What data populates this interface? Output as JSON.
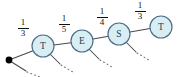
{
  "diagram": {
    "type": "weighted-path-graph",
    "origin": {
      "name": "origin-dot",
      "x": 9,
      "y": 60,
      "color": "#000000"
    },
    "node_fill": "#d8eef2",
    "node_stroke": "#4c6d86",
    "edge_color": "#4a4a4a",
    "nodes": [
      {
        "id": "n1",
        "label": "T",
        "cx": 43,
        "cy": 46,
        "r": 11
      },
      {
        "id": "n2",
        "label": "E",
        "cx": 82,
        "cy": 41,
        "r": 11
      },
      {
        "id": "n3",
        "label": "S",
        "cx": 119,
        "cy": 34,
        "r": 11
      },
      {
        "id": "n4",
        "label": "T",
        "cx": 161,
        "cy": 27,
        "r": 11
      }
    ],
    "edges": [
      {
        "id": "e0",
        "from": "origin",
        "to": "n1",
        "weight_numerator": "1",
        "weight_denominator": "3",
        "label_x": 15,
        "label_y": 18
      },
      {
        "id": "e1",
        "from": "n1",
        "to": "n2",
        "weight_numerator": "1",
        "weight_denominator": "5",
        "label_x": 56,
        "label_y": 14
      },
      {
        "id": "e2",
        "from": "n2",
        "to": "n3",
        "weight_numerator": "1",
        "weight_denominator": "4",
        "label_x": 94,
        "label_y": 7
      },
      {
        "id": "e3",
        "from": "n3",
        "to": "n4",
        "weight_numerator": "1",
        "weight_denominator": "3",
        "label_x": 132,
        "label_y": 1
      }
    ],
    "branches": [
      {
        "id": "b0",
        "from": "origin",
        "solid_x1": 10,
        "solid_y1": 61,
        "solid_x2": 26,
        "solid_y2": 71,
        "dots_x1": 27,
        "dots_y1": 72,
        "dots_x2": 40,
        "dots_y2": 77
      },
      {
        "id": "b1",
        "from": "n1",
        "solid_x1": 50,
        "solid_y1": 54,
        "solid_x2": 60,
        "solid_y2": 64,
        "dots_x1": 61,
        "dots_y1": 65,
        "dots_x2": 73,
        "dots_y2": 72
      },
      {
        "id": "b2",
        "from": "n2",
        "solid_x1": 89,
        "solid_y1": 49,
        "solid_x2": 99,
        "solid_y2": 59,
        "dots_x1": 100,
        "dots_y1": 60,
        "dots_x2": 112,
        "dots_y2": 67
      },
      {
        "id": "b3",
        "from": "n3",
        "solid_x1": 126,
        "solid_y1": 42,
        "solid_x2": 136,
        "solid_y2": 52,
        "dots_x1": 137,
        "dots_y1": 53,
        "dots_x2": 149,
        "dots_y2": 60
      }
    ]
  }
}
